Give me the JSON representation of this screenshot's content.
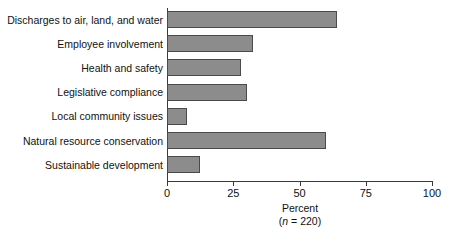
{
  "chart_data": {
    "type": "bar",
    "orientation": "horizontal",
    "title": "",
    "xlabel": "Percent",
    "ylabel": "",
    "sample_note": "(n = 220)",
    "sample_note_prefix": "(",
    "sample_note_symbol": "n",
    "sample_note_suffix": " = 220)",
    "categories": [
      "Discharges to air, land, and water",
      "Employee involvement",
      "Health and safety",
      "Legislative compliance",
      "Local community issues",
      "Natural resource conservation",
      "Sustainable development"
    ],
    "values": [
      64,
      32.5,
      28,
      30,
      7.5,
      60,
      12.5
    ],
    "xlim": [
      0,
      100
    ],
    "xticks": [
      0,
      25,
      50,
      75,
      100
    ],
    "xtick_labels": [
      "0",
      "25",
      "50",
      "75",
      "100"
    ],
    "grid": false,
    "legend": false,
    "bar_color": "#8c8c8c",
    "bar_edge_color": "#4a4a4a",
    "axis_color": "#3a3a3a",
    "background": "#ffffff"
  }
}
